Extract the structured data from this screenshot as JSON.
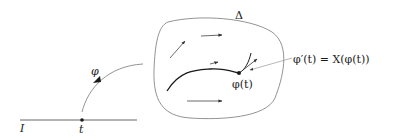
{
  "figure": {
    "interval_label": "I",
    "point_label": "t",
    "map_label": "φ",
    "domain_label": "Δ",
    "curve_point_label": "φ(t)",
    "equation": "φ′(t) = X(φ(t))"
  },
  "colors": {
    "stroke": "#1a1a1a",
    "thin_stroke": "#777777",
    "background": "#ffffff"
  }
}
